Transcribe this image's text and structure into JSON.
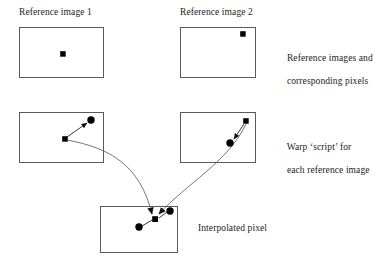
{
  "figure": {
    "background_color": "#ffffff",
    "line_color": "#555555",
    "marker_color": "#000000",
    "box_border_color": "#5a5a5a"
  },
  "labels": {
    "reference_image_1": "Reference image 1",
    "reference_image_2": "Reference image 2",
    "reference_caption_line1": "Reference images and",
    "reference_caption_line2": "corresponding pixels",
    "warp_caption_line1": "Warp ‘script’ for",
    "warp_caption_line2": "each reference image",
    "interpolated_caption": "Interpolated pixel"
  },
  "boxes": [
    {
      "id": "reference-image-1-box",
      "label": "Reference image 1",
      "x": 19,
      "y": 27,
      "width": 85,
      "height": 51,
      "markers": [
        {
          "type": "square",
          "x": 63,
          "y": 54,
          "size": 5.5
        }
      ]
    },
    {
      "id": "reference-image-2-box",
      "label": "Reference image 2",
      "x": 180,
      "y": 27,
      "width": 76,
      "height": 51,
      "markers": [
        {
          "type": "square",
          "x": 243,
          "y": 34,
          "size": 5.5
        }
      ]
    },
    {
      "id": "warp-script-left-box",
      "label": "",
      "x": 19,
      "y": 112,
      "width": 85,
      "height": 51,
      "markers": [
        {
          "type": "square",
          "x": 65,
          "y": 139,
          "size": 5.5
        },
        {
          "type": "circle",
          "x": 91,
          "y": 120,
          "radius": 3.6
        }
      ]
    },
    {
      "id": "warp-script-right-box",
      "label": "",
      "x": 180,
      "y": 112,
      "width": 76,
      "height": 51,
      "markers": [
        {
          "type": "square",
          "x": 246,
          "y": 121,
          "size": 5.5
        },
        {
          "type": "circle",
          "x": 230,
          "y": 143,
          "radius": 3.6
        }
      ]
    },
    {
      "id": "interpolated-pixel-box",
      "label": "Interpolated pixel",
      "x": 100,
      "y": 206,
      "width": 78,
      "height": 47,
      "markers": [
        {
          "type": "square",
          "x": 155,
          "y": 219,
          "size": 5.5
        },
        {
          "type": "circle",
          "x": 170,
          "y": 211,
          "radius": 3.6
        },
        {
          "type": "circle",
          "x": 139,
          "y": 227,
          "radius": 3.6
        }
      ]
    }
  ],
  "arrows": {
    "left_warp_vector": "M 66 137 L 88 123",
    "right_warp_vector": "M 244 123 L 233 140",
    "flow_left_to_interpolated": "M 67 140 C 110 148 140 165 152 214",
    "flow_right_to_interpolated": "M 246 124 C 228 160 185 182 158 214"
  },
  "text_positions": {
    "reference_image_1": {
      "x": 19,
      "y": 12
    },
    "reference_image_2": {
      "x": 180,
      "y": 12
    },
    "reference_caption": {
      "x": 277,
      "y": 42
    },
    "warp_caption": {
      "x": 277,
      "y": 131
    },
    "interpolated_caption": {
      "x": 198,
      "y": 222
    }
  }
}
